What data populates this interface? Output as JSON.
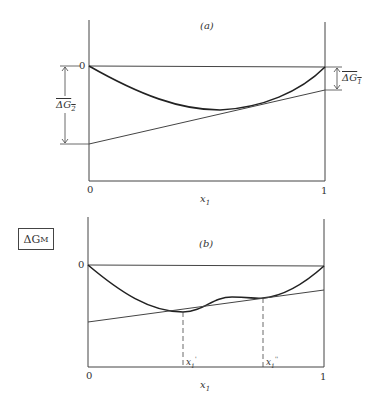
{
  "figure": {
    "y_axis_label": "ΔG",
    "y_axis_label_sub": "M",
    "panels": [
      {
        "id": "a",
        "label": "(a)",
        "x_axis_label": "x",
        "x_axis_label_sub": "1",
        "x_tick_left": "0",
        "x_tick_right": "1",
        "y_zero_label": "0",
        "left_intercept_label": "ΔG",
        "left_intercept_sub": "2",
        "right_intercept_label": "ΔG",
        "right_intercept_sub": "1"
      },
      {
        "id": "b",
        "label": "(b)",
        "x_axis_label": "x",
        "x_axis_label_sub": "1",
        "x_tick_left": "0",
        "x_tick_right": "1",
        "y_zero_label": "0",
        "tangent_point_1": "x",
        "tangent_point_1_sub": "1",
        "tangent_point_1_prime": "'",
        "tangent_point_2": "x",
        "tangent_point_2_sub": "1",
        "tangent_point_2_prime": "''"
      }
    ]
  },
  "colors": {
    "line": "#333333",
    "curve": "#222222"
  }
}
